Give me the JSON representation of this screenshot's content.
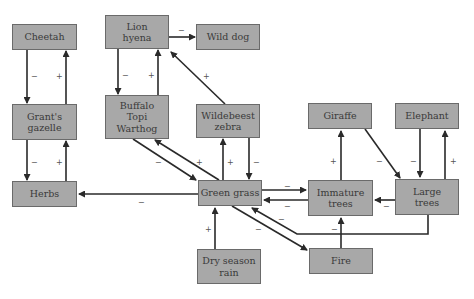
{
  "diagram": {
    "nodes": {
      "cheetah": "Cheetah",
      "lion_hyena": "Lion\nhyena",
      "wild_dog": "Wild dog",
      "grants_gazelle": "Grant's\ngazelle",
      "buffalo_topi_warthog": "Buffalo\nTopi\nWarthog",
      "wildebeest_zebra": "Wildebeest\nzebra",
      "herbs": "Herbs",
      "green_grass": "Green grass",
      "giraffe": "Giraffe",
      "elephant": "Elephant",
      "immature_trees": "Immature\ntrees",
      "large_trees": "Large\ntrees",
      "dry_season_rain": "Dry season\nrain",
      "fire": "Fire"
    },
    "edges": [
      {
        "from": "Cheetah",
        "to": "Grant's gazelle",
        "sign": "−"
      },
      {
        "from": "Grant's gazelle",
        "to": "Cheetah",
        "sign": "+"
      },
      {
        "from": "Lion hyena",
        "to": "Buffalo Topi Warthog",
        "sign": "−"
      },
      {
        "from": "Buffalo Topi Warthog",
        "to": "Lion hyena",
        "sign": "+"
      },
      {
        "from": "Lion hyena",
        "to": "Wild dog",
        "sign": "−"
      },
      {
        "from": "Wildebeest zebra",
        "to": "Lion hyena",
        "sign": "+"
      },
      {
        "from": "Grant's gazelle",
        "to": "Herbs",
        "sign": "−"
      },
      {
        "from": "Herbs",
        "to": "Grant's gazelle",
        "sign": "+"
      },
      {
        "from": "Buffalo Topi Warthog",
        "to": "Green grass",
        "sign": "−"
      },
      {
        "from": "Green grass",
        "to": "Buffalo Topi Warthog",
        "sign": "+"
      },
      {
        "from": "Green grass",
        "to": "Wildebeest zebra",
        "sign": "+"
      },
      {
        "from": "Wildebeest zebra",
        "to": "Green grass",
        "sign": "−"
      },
      {
        "from": "Green grass",
        "to": "Herbs",
        "sign": "−"
      },
      {
        "from": "Green grass",
        "to": "Immature trees",
        "sign": "−"
      },
      {
        "from": "Immature trees",
        "to": "Green grass",
        "sign": "−"
      },
      {
        "from": "Large trees",
        "to": "Green grass",
        "sign": "−"
      },
      {
        "from": "Green grass",
        "to": "Fire",
        "sign": "−"
      },
      {
        "from": "Dry season rain",
        "to": "Green grass",
        "sign": "+"
      },
      {
        "from": "Immature trees",
        "to": "Giraffe",
        "sign": "+"
      },
      {
        "from": "Giraffe",
        "to": "Large trees",
        "sign": "−"
      },
      {
        "from": "Elephant",
        "to": "Large trees",
        "sign": "−"
      },
      {
        "from": "Large trees",
        "to": "Elephant",
        "sign": "+"
      },
      {
        "from": "Large trees",
        "to": "Immature trees",
        "sign": "−"
      },
      {
        "from": "Fire",
        "to": "Immature trees",
        "sign": "−"
      }
    ],
    "signs": {
      "plus": "+",
      "minus": "−"
    }
  }
}
